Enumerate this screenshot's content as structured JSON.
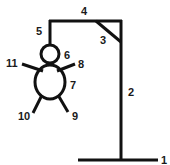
{
  "diagram": {
    "title": "",
    "colors": {
      "stroke": "#111111",
      "label": "#1a1a1a",
      "background": "#ffffff"
    },
    "parts": [
      {
        "id": "1",
        "label": "1",
        "name": "base"
      },
      {
        "id": "2",
        "label": "2",
        "name": "vertical-post"
      },
      {
        "id": "3",
        "label": "3",
        "name": "brace"
      },
      {
        "id": "4",
        "label": "4",
        "name": "top-beam"
      },
      {
        "id": "5",
        "label": "5",
        "name": "rope"
      },
      {
        "id": "6",
        "label": "6",
        "name": "head"
      },
      {
        "id": "7",
        "label": "7",
        "name": "body"
      },
      {
        "id": "8",
        "label": "8",
        "name": "right-arm"
      },
      {
        "id": "9",
        "label": "9",
        "name": "right-leg"
      },
      {
        "id": "10",
        "label": "10",
        "name": "left-leg"
      },
      {
        "id": "11",
        "label": "11",
        "name": "left-arm"
      }
    ]
  }
}
